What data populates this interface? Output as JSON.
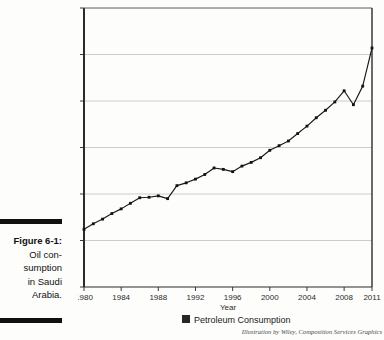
{
  "figure": {
    "label": "Figure 6-1:",
    "caption_lines": [
      "Oil con-",
      "sumption",
      "in Saudi",
      "Arabia."
    ]
  },
  "credit": "Illustration by Wiley, Composition Services Graphics",
  "legend": {
    "swatch_color": "#262626",
    "entries": [
      "Petroleum Consumption"
    ]
  },
  "colors": {
    "line": "#1a1a1a",
    "marker": "#111111",
    "grid": "#bfbfbf",
    "axis": "#3a3a3a",
    "background": "#fdfdfc"
  },
  "chart_data": {
    "type": "line",
    "title": "",
    "xlabel": "Year",
    "ylabel": "",
    "xlim": [
      1980,
      2011
    ],
    "ylim": [
      0,
      3000
    ],
    "grid": true,
    "legend_position": "bottom",
    "ytick_labels": [
      "0",
      "500",
      "1,000",
      "1,500",
      "2,000",
      "2,500",
      "3,000"
    ],
    "yticks": [
      0,
      500,
      1000,
      1500,
      2000,
      2500,
      3000
    ],
    "xtick_labels": [
      "1980",
      "1984",
      "1988",
      "1992",
      "1996",
      "2000",
      "2004",
      "2008",
      "2011"
    ],
    "xticks": [
      1980,
      1984,
      1988,
      1992,
      1996,
      2000,
      2004,
      2008,
      2011
    ],
    "series": [
      {
        "name": "Petroleum Consumption",
        "x": [
          1980,
          1981,
          1982,
          1983,
          1984,
          1985,
          1986,
          1987,
          1988,
          1989,
          1990,
          1991,
          1992,
          1993,
          1994,
          1995,
          1996,
          1997,
          1998,
          1999,
          2000,
          2001,
          2002,
          2003,
          2004,
          2005,
          2006,
          2007,
          2008,
          2009,
          2010,
          2011
        ],
        "values": [
          620,
          680,
          730,
          790,
          840,
          900,
          960,
          965,
          980,
          950,
          1090,
          1120,
          1160,
          1210,
          1280,
          1265,
          1240,
          1300,
          1340,
          1390,
          1470,
          1520,
          1570,
          1650,
          1730,
          1820,
          1900,
          1990,
          2110,
          1960,
          2160,
          2570
        ]
      }
    ]
  }
}
